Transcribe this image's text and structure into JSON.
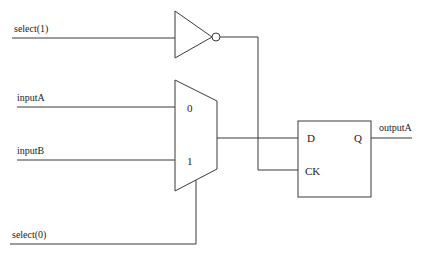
{
  "diagram": {
    "type": "logic-circuit",
    "signals": {
      "select1": "select(1)",
      "select0": "select(0)",
      "inputA": "inputA",
      "inputB": "inputB",
      "outputA": "outputA"
    },
    "mux": {
      "input0_label": "0",
      "input1_label": "1"
    },
    "flipflop": {
      "d_label": "D",
      "ck_label": "CK",
      "q_label": "Q"
    },
    "colors": {
      "line": "#3a3a3a",
      "text": "#222222",
      "background": "#ffffff"
    }
  }
}
